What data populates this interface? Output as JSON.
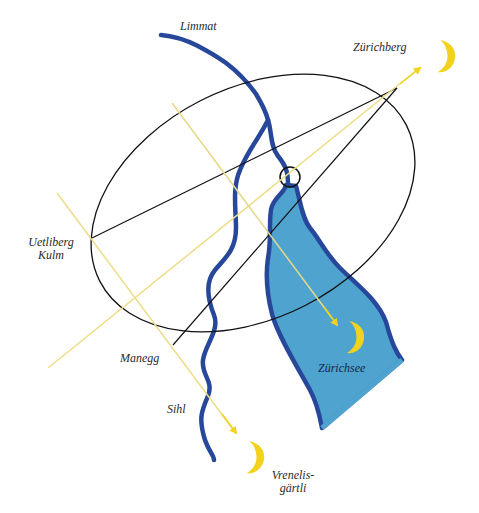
{
  "diagram": {
    "colors": {
      "river": "#27489a",
      "lake_fill": "#4fa3cf",
      "lake_border": "#27489a",
      "ellipse": "#111111",
      "sight_line": "#eedd88",
      "arrow": "#f2d21b",
      "moon": "#f2d21b"
    },
    "labels": {
      "limmat": "Limmat",
      "zuerichberg": "Zürichberg",
      "uetliberg_line1": "Uetliberg",
      "uetliberg_line2": "Kulm",
      "manegg": "Manegg",
      "sihl": "Sihl",
      "zuerichsee": "Zürichsee",
      "vrenelis_line1": "Vrenelis-",
      "vrenelis_line2": "gärtli"
    },
    "points": [
      {
        "name": "Zürichberg",
        "x": 397,
        "y": 88
      },
      {
        "name": "Uetliberg Kulm",
        "x": 92,
        "y": 238
      },
      {
        "name": "Manegg",
        "x": 173,
        "y": 345
      },
      {
        "name": "Center circle",
        "x": 290,
        "y": 177
      }
    ],
    "moons": [
      {
        "name": "moon-zuerichberg",
        "x": 440,
        "y": 52
      },
      {
        "name": "moon-zuerichsee",
        "x": 356,
        "y": 330
      },
      {
        "name": "moon-vrenelisgaertli",
        "x": 256,
        "y": 455
      }
    ]
  }
}
